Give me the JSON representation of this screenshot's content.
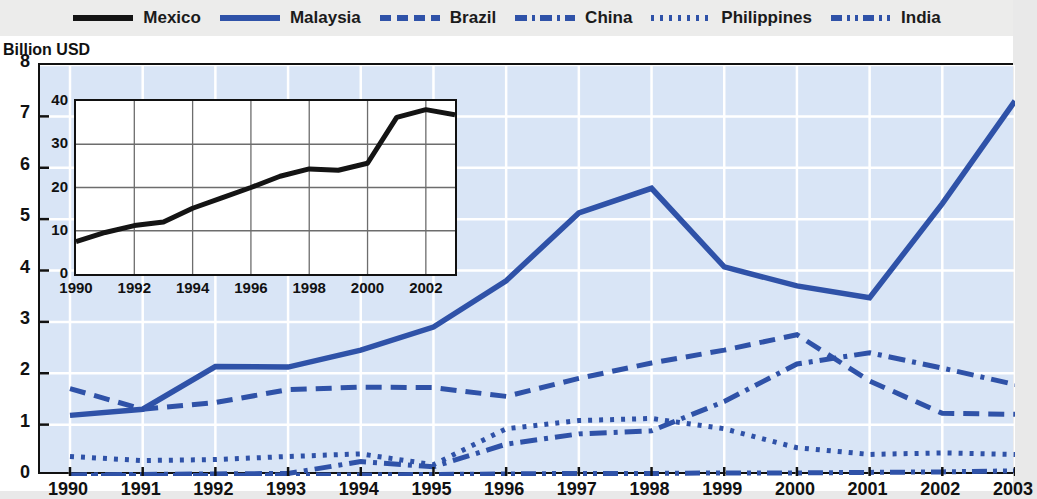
{
  "legend": {
    "items": [
      {
        "label": "Mexico",
        "color": "#141414",
        "style": "solid",
        "name": "legend-item-mexico"
      },
      {
        "label": "Malaysia",
        "color": "#2f52a8",
        "style": "solid",
        "name": "legend-item-malaysia"
      },
      {
        "label": "Brazil",
        "color": "#2f52a8",
        "style": "dashed",
        "name": "legend-item-brazil"
      },
      {
        "label": "China",
        "color": "#2f52a8",
        "style": "dashdot",
        "name": "legend-item-china"
      },
      {
        "label": "Philippines",
        "color": "#2f52a8",
        "style": "dotted",
        "name": "legend-item-philippines"
      },
      {
        "label": "India",
        "color": "#2f52a8",
        "style": "longdashdotdot",
        "name": "legend-item-india"
      }
    ]
  },
  "axis": {
    "y_unit_label": "Billion USD",
    "y_ticks": [
      "8",
      "7",
      "6",
      "5",
      "4",
      "3",
      "2",
      "1",
      "0"
    ],
    "x_ticks": [
      "1990",
      "1991",
      "1992",
      "1993",
      "1994",
      "1995",
      "1996",
      "1997",
      "1998",
      "1999",
      "2000",
      "2001",
      "2002",
      "2003"
    ]
  },
  "inset_axis": {
    "y_ticks": [
      "40",
      "30",
      "20",
      "10",
      "0"
    ],
    "x_ticks": [
      "1990",
      "1992",
      "1994",
      "1996",
      "1998",
      "2000",
      "2002"
    ]
  },
  "colors": {
    "plot_background": "#d9e5f6",
    "series_blue": "#2f52a8",
    "series_black": "#141414",
    "gridline": "#ffffff",
    "axis": "#111111",
    "legend_background": "#ececeb",
    "inset_background": "#ffffff",
    "inset_gridline": "#6d6d6d"
  },
  "chart_data": {
    "type": "line",
    "title": "",
    "subtitle": "",
    "xlabel": "",
    "ylabel": "Billion USD",
    "xlim": [
      1990,
      2003
    ],
    "ylim": [
      0,
      8
    ],
    "grid": true,
    "legend_position": "top",
    "x": [
      1990,
      1991,
      1992,
      1993,
      1994,
      1995,
      1996,
      1997,
      1998,
      1999,
      2000,
      2001,
      2002,
      2003
    ],
    "series": [
      {
        "name": "Malaysia",
        "style": "solid",
        "color": "#2f52a8",
        "values": [
          1.18,
          1.3,
          2.13,
          2.12,
          2.45,
          2.9,
          3.8,
          5.12,
          5.6,
          4.07,
          3.7,
          3.47,
          5.3,
          7.3
        ]
      },
      {
        "name": "Brazil",
        "style": "dashed",
        "color": "#2f52a8",
        "values": [
          1.7,
          1.3,
          1.43,
          1.68,
          1.73,
          1.72,
          1.55,
          1.9,
          2.2,
          2.45,
          2.75,
          1.85,
          1.22,
          1.2
        ]
      },
      {
        "name": "China",
        "style": "dashdot",
        "color": "#2f52a8",
        "values": [
          0.02,
          0.03,
          0.04,
          0.05,
          0.28,
          0.18,
          0.62,
          0.82,
          0.88,
          1.45,
          2.18,
          2.4,
          2.1,
          1.78
        ]
      },
      {
        "name": "Philippines",
        "style": "dotted",
        "color": "#2f52a8",
        "values": [
          0.38,
          0.3,
          0.32,
          0.38,
          0.43,
          0.22,
          0.92,
          1.08,
          1.12,
          0.92,
          0.55,
          0.42,
          0.45,
          0.42
        ]
      },
      {
        "name": "India",
        "style": "longdashdotdot",
        "color": "#2f52a8",
        "values": [
          0.01,
          0.01,
          0.01,
          0.02,
          0.02,
          0.03,
          0.04,
          0.05,
          0.05,
          0.06,
          0.06,
          0.07,
          0.08,
          0.1
        ]
      }
    ]
  },
  "inset_chart_data": {
    "type": "line",
    "title": "",
    "xlabel": "",
    "ylabel": "",
    "xlim": [
      1990,
      2003
    ],
    "ylim": [
      0,
      40
    ],
    "grid": true,
    "legend_position": "none",
    "x": [
      1990,
      1991,
      1992,
      1993,
      1994,
      1995,
      1996,
      1997,
      1998,
      1999,
      2000,
      2001,
      2002,
      2003
    ],
    "series": [
      {
        "name": "Mexico",
        "style": "solid",
        "color": "#141414",
        "values": [
          7.5,
          9.6,
          11.2,
          12.0,
          15.2,
          17.6,
          20.0,
          22.6,
          24.3,
          24.0,
          25.6,
          36.2,
          38.0,
          36.8
        ]
      }
    ]
  }
}
